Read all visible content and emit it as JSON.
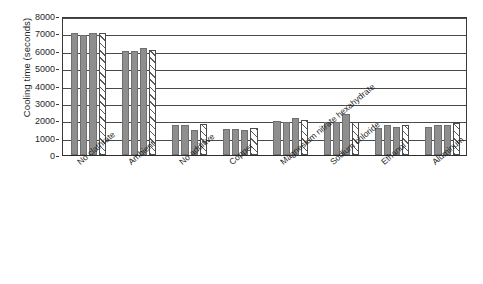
{
  "chart_data": {
    "type": "bar",
    "title": "",
    "subtitle": "",
    "xlabel": "",
    "ylabel": "Cooling time (seconds)",
    "ylim": [
      0,
      8000
    ],
    "ytick_labels": [
      "8000",
      "7000",
      "6000",
      "5000",
      "4000",
      "3000",
      "2000",
      "1000",
      "0"
    ],
    "ytick_values": [
      8000,
      7000,
      6000,
      5000,
      4000,
      3000,
      2000,
      1000,
      0
    ],
    "grid": true,
    "grid_axis": "y",
    "legend": false,
    "legend_position": "none",
    "orientation": "vertical",
    "categories": [
      "No clathrate",
      "Ambient",
      "No additive",
      "Copper",
      "Magnesium nitrate hexahydrate",
      "Sodium chloride",
      "Ethanol",
      "Aluminum"
    ],
    "series": [
      {
        "name": "Trial 1",
        "style": "solid-gray",
        "values": [
          7050,
          6000,
          1700,
          1500,
          1950,
          1900,
          1550,
          1600
        ]
      },
      {
        "name": "Trial 2",
        "style": "solid-gray",
        "values": [
          6900,
          6000,
          1700,
          1500,
          1900,
          1900,
          1700,
          1700
        ]
      },
      {
        "name": "Trial 3",
        "style": "solid-gray",
        "values": [
          7000,
          6150,
          1450,
          1450,
          2150,
          2350,
          1600,
          1750
        ]
      },
      {
        "name": "Average",
        "style": "hatched",
        "values": [
          7000,
          6050,
          1800,
          1550,
          2000,
          1900,
          1750,
          1850
        ]
      }
    ],
    "colors": {
      "bar_fill": "#8e8e8e",
      "bar_edge": "#6f6f6f",
      "hatch_line": "#5a5a5a",
      "axis": "#3a3a3a",
      "grid": "#4a4a4a",
      "background": "#ffffff",
      "text": "#1f1f1f"
    }
  }
}
